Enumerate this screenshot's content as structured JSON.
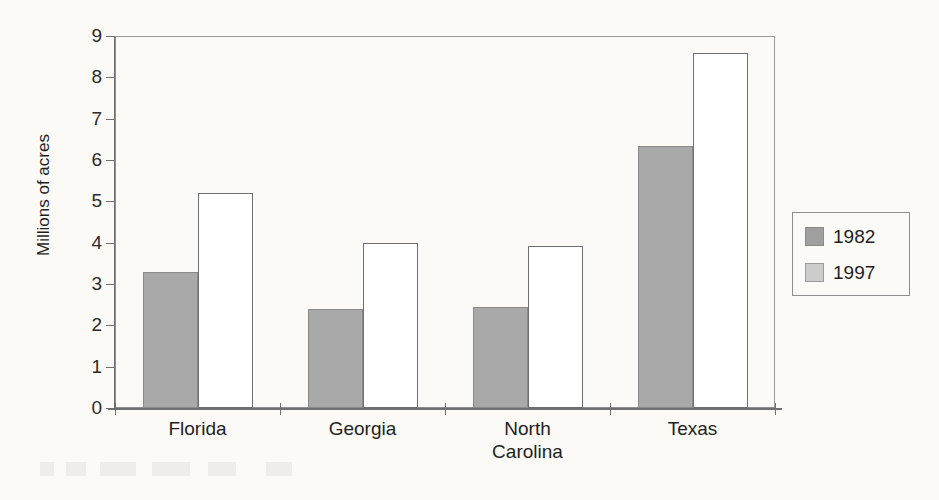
{
  "chart_data": {
    "type": "bar",
    "title": "",
    "xlabel": "",
    "ylabel": "Millions of acres",
    "ylim": [
      0,
      9
    ],
    "ytick_values": [
      0,
      1,
      2,
      3,
      4,
      5,
      6,
      7,
      8,
      9
    ],
    "ytick_labels": [
      "0",
      "1",
      "2",
      "3",
      "4",
      "5",
      "6",
      "7",
      "8",
      "9"
    ],
    "grid": false,
    "legend_position": "right-outside",
    "categories": [
      "Florida",
      "Georgia",
      "North Carolina",
      "Texas"
    ],
    "category_labels": [
      [
        "Florida"
      ],
      [
        "Georgia"
      ],
      [
        "North",
        "Carolina"
      ],
      [
        "Texas"
      ]
    ],
    "series": [
      {
        "name": "1982",
        "color": "#a9a9a9",
        "values": [
          3.3,
          2.4,
          2.45,
          6.35
        ]
      },
      {
        "name": "1997",
        "color": "#ffffff",
        "values": [
          5.2,
          4.0,
          3.93,
          8.6
        ]
      }
    ]
  },
  "axis": {
    "y_title": "Millions of acres"
  },
  "legend": {
    "entries": [
      {
        "label": "1982",
        "swatch": "dark-gray-swatch"
      },
      {
        "label": "1997",
        "swatch": "light-gray-swatch"
      }
    ]
  }
}
